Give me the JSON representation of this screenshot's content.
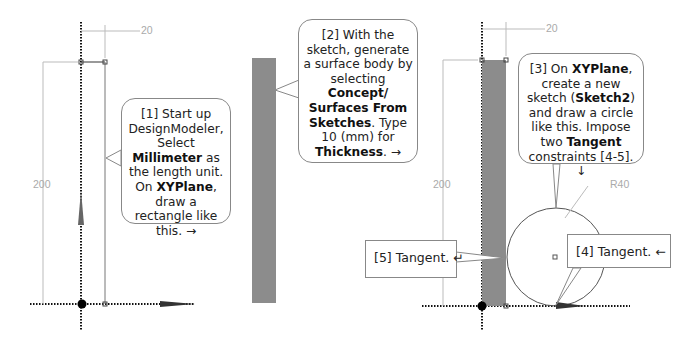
{
  "figure": {
    "panels": [
      {
        "id": "panel-1",
        "dimensions": {
          "width_label": "20",
          "height_label": "200"
        },
        "callout": {
          "parts": [
            {
              "text": "[1] Start up DesignModeler, Select ",
              "bold": false
            },
            {
              "text": "Millimeter",
              "bold": true
            },
            {
              "text": " as the length unit. On ",
              "bold": false
            },
            {
              "text": "XYPlane",
              "bold": true
            },
            {
              "text": ", draw a rectangle like this. →",
              "bold": false
            }
          ]
        }
      },
      {
        "id": "panel-2",
        "callout": {
          "parts": [
            {
              "text": "[2] With the sketch, generate a surface body by selecting ",
              "bold": false
            },
            {
              "text": "Concept/ Surfaces From Sketches",
              "bold": true
            },
            {
              "text": ". Type 10 (mm) for ",
              "bold": false
            },
            {
              "text": "Thickness",
              "bold": true
            },
            {
              "text": ". →",
              "bold": false
            }
          ]
        }
      },
      {
        "id": "panel-3",
        "dimensions": {
          "width_label": "20",
          "height_label": "200",
          "radius_label": "R40"
        },
        "callout": {
          "parts": [
            {
              "text": "[3] On ",
              "bold": false
            },
            {
              "text": "XYPlane",
              "bold": true
            },
            {
              "text": ", create a new sketch (",
              "bold": false
            },
            {
              "text": "Sketch2",
              "bold": true
            },
            {
              "text": ") and draw a circle like this.  Impose two ",
              "bold": false
            },
            {
              "text": "Tangent",
              "bold": true
            },
            {
              "text": " constraints [4-5]. ↓",
              "bold": false
            }
          ]
        },
        "tangent_labels": {
          "t4": "[4] Tangent.  ←",
          "t5": "[5] Tangent.  ↵"
        }
      }
    ],
    "colors": {
      "surface_fill": "#8c8c8c",
      "dimension_line": "#b0b0b0",
      "axis": "#111111",
      "callout_border": "#888888"
    }
  }
}
